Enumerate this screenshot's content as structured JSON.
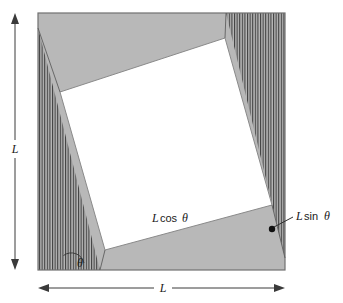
{
  "figure": {
    "labels": {
      "height_dim": "L",
      "width_dim": "L",
      "cos_label_var": "L",
      "cos_label_fn": "cos",
      "cos_label_angle": "θ",
      "sin_label_var": "L",
      "sin_label_fn": "sin",
      "sin_label_angle": "θ",
      "angle_symbol": "θ"
    },
    "colors": {
      "gray_fill": "#b8b8b8",
      "hatch_line": "#4a4a4a",
      "outline": "#6e6e6e",
      "white_fill": "#ffffff",
      "text": "#1a1a1a",
      "dimension": "#3a3a3a",
      "marker_dot": "#111111"
    },
    "geometry": {
      "outer_square": {
        "x": 38,
        "y": 13,
        "width": 247,
        "height": 257
      },
      "inner_square_points": "60,92 225,38 272,205 105,250",
      "hatch_left_points": "38,28 38,270 100,270",
      "hatch_right_points": "226,13 285,13 285,258",
      "angle_marker": {
        "cx": 71,
        "cy": 263,
        "radius": 13
      },
      "dot_marker": {
        "cx": 272,
        "cy": 229,
        "r": 3
      },
      "vertical_dim_x": 15,
      "vertical_dim_top": 15,
      "vertical_dim_bottom": 268,
      "horizontal_dim_y": 288,
      "horizontal_dim_left": 38,
      "horizontal_dim_right": 285
    }
  }
}
